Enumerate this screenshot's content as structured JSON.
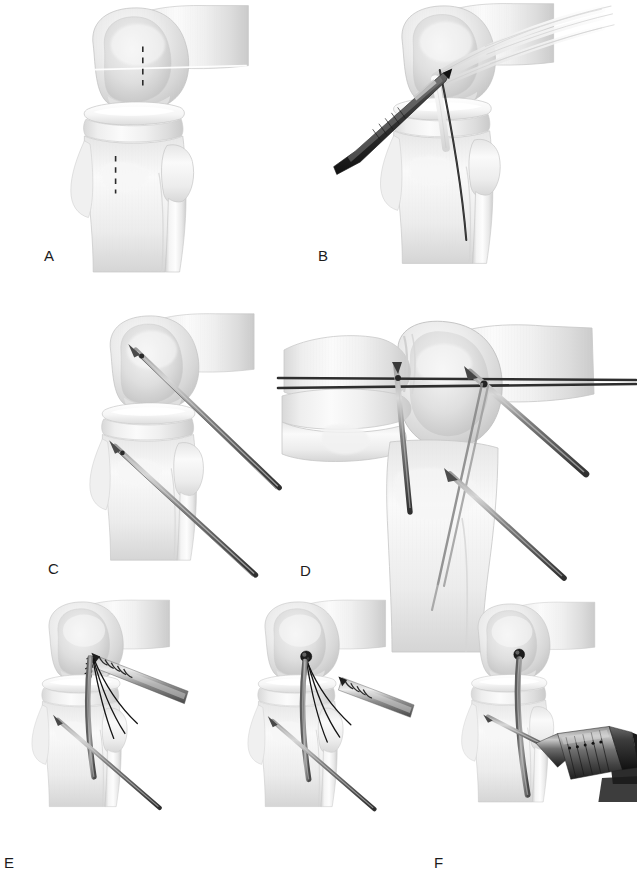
{
  "figure": {
    "view_note": "Six-step surgical illustration of knee ligament reconstruction",
    "background_color": "#ffffff",
    "bone_fill": "#f2f2f2",
    "bone_shade": "#cfcfcf",
    "bone_outline": "#bdbdbd",
    "instrument_dark": "#3a3a3a",
    "instrument_mid": "#7d7d7d",
    "instrument_light": "#b5b5b5",
    "suture_color": "#1f1f1f",
    "guide_line_color": "#2b2b2b"
  },
  "panels": [
    {
      "id": "A",
      "label": "A",
      "label_x": 44,
      "label_y": 255,
      "caption": "Knee joint with dashed incision and tunnel reference marks",
      "anatomy": [
        "femur",
        "femoral condyle",
        "tibia",
        "tibial tuberosity",
        "fibula",
        "joint line"
      ],
      "instruments": [],
      "markers": [
        "dashed-line-femur",
        "dashed-line-tibia",
        "joint-line-highlight"
      ]
    },
    {
      "id": "B",
      "label": "B",
      "label_x": 318,
      "label_y": 255,
      "caption": "Rasp elevating soft tissue with graft strands and guide suture in place",
      "anatomy": [
        "femur",
        "femoral condyle",
        "tibia",
        "fibula"
      ],
      "instruments": [
        "rasp-elevator",
        "graft-strands",
        "guide-suture"
      ],
      "markers": [
        "joint-line-highlight"
      ]
    },
    {
      "id": "C",
      "label": "C",
      "label_x": 48,
      "label_y": 568,
      "caption": "Two guide pins drilled into the femoral condyle and proximal tibia",
      "anatomy": [
        "femur",
        "femoral condyle",
        "tibia",
        "tibial tuberosity",
        "fibula"
      ],
      "instruments": [
        "femoral-guide-pin",
        "tibial-guide-pin"
      ],
      "markers": [
        "pin-entry-point-femur",
        "pin-entry-point-tibia"
      ]
    },
    {
      "id": "D",
      "label": "D",
      "label_x": 300,
      "label_y": 570,
      "caption": "Oblique view showing parallel reference wires crossing the guide pins",
      "anatomy": [
        "femur",
        "femoral condyle",
        "tibia",
        "fibula",
        "patella"
      ],
      "instruments": [
        "reference-wire-upper",
        "reference-wire-lower",
        "vertical-pin",
        "oblique-pin",
        "long-guide-pin"
      ],
      "markers": [
        "wire-crossing-point-medial",
        "wire-crossing-point-lateral"
      ]
    },
    {
      "id": "E",
      "label": "E",
      "label_x": 4,
      "label_y": 862,
      "caption": "Threaded suture anchor delivered on driver, then seated with driver withdrawn",
      "sub_panels": [
        {
          "id": "E1",
          "caption": "Anchor on inserter engaging the femoral attachment site",
          "instruments": [
            "suture-anchor",
            "anchor-driver",
            "suture-limbs",
            "graft-strand",
            "tibial-guide-pin"
          ]
        },
        {
          "id": "E2",
          "caption": "Anchor seated, driver backing out leaving suture limbs",
          "instruments": [
            "seated-anchor-head",
            "anchor-driver",
            "suture-limbs",
            "graft-strand",
            "tibial-guide-pin"
          ]
        }
      ]
    },
    {
      "id": "F",
      "label": "F",
      "label_x": 434,
      "label_y": 862,
      "caption": "Power drill with keyed chuck advancing the guide pin alongside the fixed graft",
      "anatomy": [
        "femur",
        "femoral condyle",
        "tibia",
        "fibula"
      ],
      "instruments": [
        "seated-anchor-head",
        "graft-strand",
        "guide-pin",
        "drill-chuck",
        "power-drill-body"
      ]
    }
  ]
}
